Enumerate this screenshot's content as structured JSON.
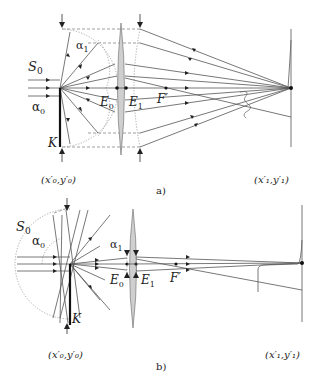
{
  "figure": {
    "panel_a": {
      "caption": "a)",
      "labels": {
        "S0": "S",
        "S0_sub": "0",
        "alpha0": "α",
        "alpha0_sub": "0",
        "alpha1": "α",
        "alpha1_sub": "1",
        "K": "K",
        "E0": "E",
        "E0_sub": "0",
        "E1": "E",
        "E1_sub": "1",
        "F_prime": "F′",
        "object_coords": "(x′₀,y′₀)",
        "image_coords": "(x′₁,y′₁)"
      }
    },
    "panel_b": {
      "caption": "b)",
      "labels": {
        "S0": "S",
        "S0_sub": "0",
        "alpha0": "α",
        "alpha0_sub": "0",
        "alpha1": "α",
        "alpha1_sub": "1",
        "K": "K",
        "E0": "E",
        "E0_sub": "0",
        "E1": "E",
        "E1_sub": "1",
        "F_prime": "F′",
        "object_coords": "(x′₀,y′₀)",
        "image_coords": "(x′₁,y′₁)"
      }
    },
    "colors": {
      "lens_fill": "#cfcfcf",
      "ray": "#555555",
      "background": "#ffffff"
    }
  }
}
